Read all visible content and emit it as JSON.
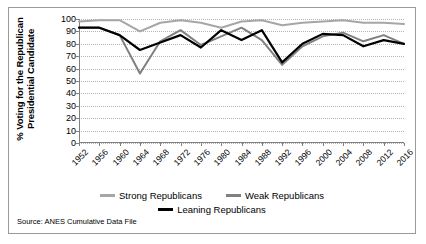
{
  "chart_data": {
    "type": "line",
    "title": "",
    "xlabel": "",
    "ylabel": "% Voting for the Republican Presidential Candidate",
    "ylabel_line1": "% Voting for the Republican",
    "ylabel_line2": "Presidential Candidate",
    "ylim": [
      0,
      100
    ],
    "ytick_step": 10,
    "yticks": [
      100,
      90,
      80,
      70,
      60,
      50,
      40,
      30,
      20,
      10,
      0
    ],
    "grid": true,
    "legend_position": "bottom",
    "categories": [
      1952,
      1956,
      1960,
      1964,
      1968,
      1972,
      1976,
      1980,
      1984,
      1988,
      1992,
      1996,
      2000,
      2004,
      2008,
      2012,
      2016
    ],
    "xtick_labels": [
      "1952",
      "1956",
      "1960",
      "1964",
      "1968",
      "1972",
      "1976",
      "1980",
      "1984",
      "1988",
      "1992",
      "1996",
      "2000",
      "2004",
      "2008",
      "2012",
      "2016"
    ],
    "series": [
      {
        "name": "Strong Republicans",
        "color": "#a6a6a6",
        "values": [
          98,
          99,
          99,
          90,
          97,
          99,
          97,
          93,
          98,
          99,
          95,
          97,
          98,
          99,
          97,
          97,
          96
        ]
      },
      {
        "name": "Weak Republicans",
        "color": "#808080",
        "values": [
          93,
          93,
          87,
          56,
          82,
          91,
          79,
          86,
          93,
          83,
          63,
          78,
          86,
          89,
          82,
          87,
          80
        ]
      },
      {
        "name": "Leaning Republicans",
        "color": "#000000",
        "values": [
          93,
          93,
          87,
          75,
          81,
          87,
          77,
          91,
          83,
          91,
          65,
          80,
          88,
          87,
          78,
          83,
          80
        ]
      }
    ]
  },
  "legend": {
    "items": [
      {
        "label": "Strong Republicans",
        "color": "#a6a6a6"
      },
      {
        "label": "Weak Republicans",
        "color": "#808080"
      },
      {
        "label": "Leaning Republicans",
        "color": "#000000"
      }
    ]
  },
  "source": {
    "text": "Source: ANES Cumulative Data File"
  }
}
